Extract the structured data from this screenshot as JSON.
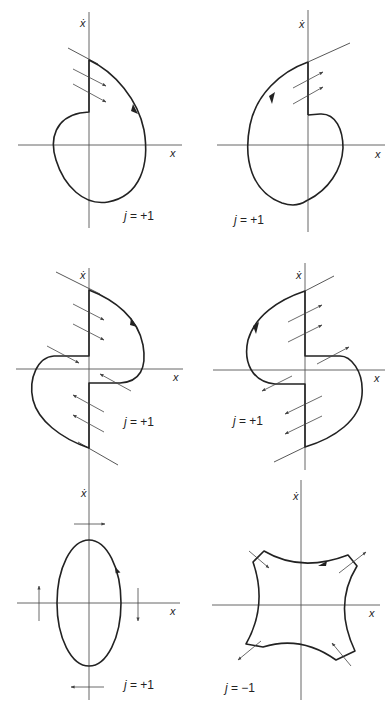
{
  "figure": {
    "panels": [
      {
        "id": "p1",
        "x_axis_label": "x",
        "y_axis_label": "ẋ",
        "j_label": "j = +1",
        "j_sign": "+1",
        "direction": "counterclockwise arrow on right branch, upward"
      },
      {
        "id": "p2",
        "x_axis_label": "x",
        "y_axis_label": "ẋ",
        "j_label": "j = +1",
        "j_sign": "+1",
        "direction": "arrow on upper-left branch, downward-left"
      },
      {
        "id": "p3",
        "x_axis_label": "x",
        "y_axis_label": "ẋ",
        "j_label": "j = +1",
        "j_sign": "+1",
        "direction": "arrow on upper-right branch"
      },
      {
        "id": "p4",
        "x_axis_label": "x",
        "y_axis_label": "ẋ",
        "j_label": "j = +1",
        "j_sign": "+1",
        "direction": "arrow on upper-left branch"
      },
      {
        "id": "p5",
        "x_axis_label": "x",
        "y_axis_label": "ẋ",
        "j_label": "j = +1",
        "j_sign": "+1",
        "direction": "arrow on right side of ellipse, pointing up"
      },
      {
        "id": "p6",
        "x_axis_label": "x",
        "y_axis_label": "ẋ",
        "j_label": "j = −1",
        "j_sign": "−1",
        "direction": "arrow on top concave edge pointing left"
      }
    ]
  },
  "labels": {
    "p1": {
      "y": "ẋ",
      "x": "x",
      "j": "j = +1"
    },
    "p2": {
      "y": "ẋ",
      "x": "x",
      "j": "j = +1"
    },
    "p3": {
      "y": "ẋ",
      "x": "x",
      "j": "j = +1"
    },
    "p4": {
      "y": "ẋ",
      "x": "x",
      "j": "j = +1"
    },
    "p5": {
      "y": "ẋ",
      "x": "x",
      "j": "j = +1"
    },
    "p6": {
      "y": "ẋ",
      "x": "x",
      "j": "j = −1"
    }
  },
  "colors": {
    "ink": "#222222",
    "axis": "#555555",
    "background": "#ffffff"
  }
}
